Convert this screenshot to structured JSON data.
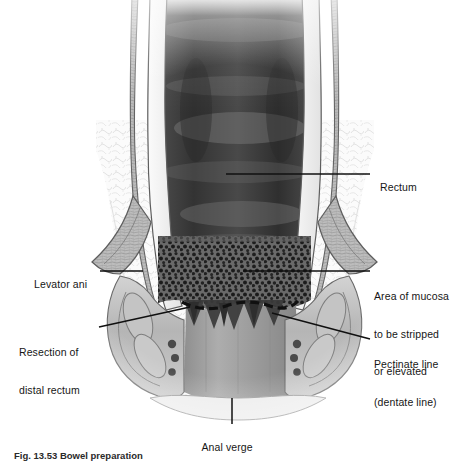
{
  "figure": {
    "style": "grayscale medical line-and-wash illustration",
    "palette": {
      "background": "#ffffff",
      "lumen_dark": "#3d3d3d",
      "lumen_mid": "#6e6e6e",
      "wall_light": "#f2f2f2",
      "wall_outline": "#5a5a5a",
      "muscle_fill": "#b9b9b9",
      "muscle_texture": "#8d8d8d",
      "stipple": "#2b2b2b",
      "anal_canal": "#9a9a9a",
      "leader_line": "#101010",
      "vessel": "#4a4a4a"
    }
  },
  "labels": {
    "rectum": {
      "text": "Rectum",
      "side": "right",
      "x": 374,
      "y": 168,
      "leader": {
        "x1": 370,
        "y1": 174,
        "x2": 226,
        "y2": 174
      }
    },
    "area_of_mucosa": {
      "line1": "Area of mucosa",
      "line2": "to be stripped",
      "line3": "or elevated",
      "side": "right",
      "x": 374,
      "y": 265,
      "leader": {
        "x1": 370,
        "y1": 271,
        "x2": 243,
        "y2": 271
      }
    },
    "pectinate_line": {
      "line1": "Pectinate line",
      "line2": "(dentate line)",
      "side": "right",
      "x": 374,
      "y": 333,
      "leader": {
        "x1": 370,
        "y1": 339,
        "x2": 272,
        "y2": 313
      }
    },
    "levator_ani": {
      "text": "Levator ani",
      "side": "left",
      "x": 28,
      "y": 265,
      "leader": {
        "x1": 100,
        "y1": 271,
        "x2": 143,
        "y2": 271
      }
    },
    "resection_of_distal_rectum": {
      "line1": "Resection of",
      "line2": "distal rectum",
      "side": "left",
      "x": 19,
      "y": 321,
      "leader": {
        "x1": 99,
        "y1": 327,
        "x2": 190,
        "y2": 307
      }
    },
    "anal_verge": {
      "text": "Anal verge",
      "side": "center",
      "x": 196,
      "y": 428,
      "leader": {
        "x1": 232,
        "y1": 424,
        "x2": 232,
        "y2": 398
      }
    }
  },
  "caption": {
    "text": "Fig. 13.53 Bowel preparation"
  },
  "anatomy": {
    "rectum_lumen": "dark grey tubular lumen with lighter transverse mucosal folds",
    "mucosa_strip_zone": "stippled dark band spanning the distal rectum above the dentate line",
    "dentate_line": "dashed resection line following a sawtooth arc",
    "anal_columns_count": 6,
    "sphincter_vessels_per_side": 3,
    "levator_ani": "angled muscular band sweeping laterally from the rectal wall"
  }
}
